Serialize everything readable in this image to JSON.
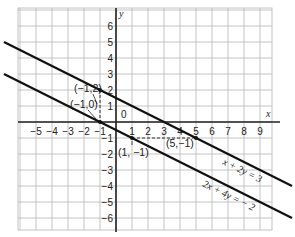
{
  "chart_data": {
    "type": "line",
    "title": "",
    "xlabel": "x",
    "ylabel": "y",
    "xlim": [
      -6.1,
      9.75
    ],
    "ylim": [
      -6.75,
      7.1
    ],
    "grid": true,
    "x_ticks": [
      -5,
      -4,
      -3,
      -2,
      -1,
      1,
      2,
      3,
      4,
      5,
      6,
      7,
      8,
      9
    ],
    "y_ticks": [
      6,
      5,
      4,
      3,
      2,
      1,
      -1,
      -2,
      -3,
      -4,
      -5,
      -6
    ],
    "origin_label": "0",
    "series": [
      {
        "name": "x + 2y = 3",
        "equation": "x+2y=3",
        "x": [
          -7,
          11
        ],
        "y": [
          5,
          -4
        ]
      },
      {
        "name": "2x + 4y = -2",
        "equation": "2x+4y=-2",
        "x": [
          -7,
          11
        ],
        "y": [
          3,
          -6
        ]
      }
    ],
    "annotations": [
      {
        "label": "(-1,2)",
        "x": -1,
        "y": 2
      },
      {
        "label": "(-1,0)",
        "x": -1,
        "y": 0
      },
      {
        "label": "(1,-1)",
        "x": 1,
        "y": -1
      },
      {
        "label": "(5,-1)",
        "x": 5,
        "y": -1
      }
    ],
    "dashed_segments": [
      {
        "from": [
          -1,
          2
        ],
        "to": [
          -1,
          0
        ]
      },
      {
        "from": [
          1,
          -1
        ],
        "to": [
          5,
          -1
        ]
      }
    ]
  },
  "labels": {
    "x_axis": "x",
    "y_axis": "y",
    "origin": "0",
    "eq1": "x + 2y = 3",
    "eq2": "2x + 4y = − 2",
    "p1": "(−1,2)",
    "p2": "(−1,0)",
    "p3": "(1, −1)",
    "p4": "(5,−1)"
  }
}
